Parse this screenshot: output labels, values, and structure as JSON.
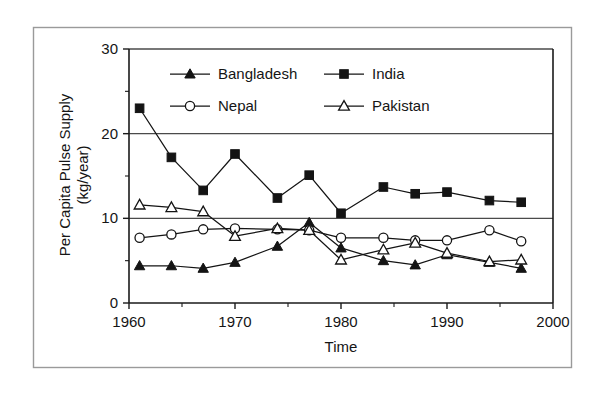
{
  "figure": {
    "caption_present": false,
    "frame_color": "#9a9a9a",
    "ink_color": "#141414"
  },
  "axes": {
    "y_title_line1": "Per Capita Pulse Supply",
    "y_title_line2": "(kg/year)",
    "x_title": "Time",
    "y_ticks": [
      "0",
      "10",
      "20",
      "30"
    ],
    "x_ticks": [
      "1960",
      "1970",
      "1980",
      "1990",
      "2000"
    ]
  },
  "legend": {
    "position": "inside-top-center",
    "entries": [
      {
        "label": "Bangladesh",
        "marker": "filled-triangle-icon"
      },
      {
        "label": "India",
        "marker": "filled-square-icon"
      },
      {
        "label": "Nepal",
        "marker": "open-circle-icon"
      },
      {
        "label": "Pakistan",
        "marker": "open-triangle-icon"
      }
    ]
  },
  "chart_data": {
    "type": "line",
    "title": "",
    "xlabel": "Time",
    "ylabel": "Per Capita Pulse Supply (kg/year)",
    "xlim": [
      1960,
      2000
    ],
    "ylim": [
      0,
      30
    ],
    "xticks": [
      1960,
      1970,
      1980,
      1990,
      2000
    ],
    "yticks": [
      0,
      10,
      20,
      30
    ],
    "minor_yticks": [
      5,
      15,
      25
    ],
    "minor_xticks": [
      1965,
      1975,
      1985,
      1995
    ],
    "grid": "horizontal-major",
    "legend_position": "upper center inside axes",
    "x": [
      1961,
      1964,
      1967,
      1970,
      1974,
      1977,
      1980,
      1984,
      1987,
      1990,
      1994,
      1997
    ],
    "series": [
      {
        "name": "Bangladesh",
        "marker": "filled-triangle",
        "values": [
          4.4,
          4.4,
          4.1,
          4.8,
          6.7,
          9.5,
          6.5,
          5.0,
          4.5,
          5.7,
          4.8,
          4.1
        ]
      },
      {
        "name": "India",
        "marker": "filled-square",
        "values": [
          23.0,
          17.2,
          13.3,
          17.6,
          12.4,
          15.1,
          10.6,
          13.7,
          12.9,
          13.1,
          12.1,
          11.9
        ]
      },
      {
        "name": "Nepal",
        "marker": "open-circle",
        "values": [
          7.7,
          8.1,
          8.7,
          8.8,
          8.7,
          8.6,
          7.7,
          7.7,
          7.4,
          7.4,
          8.6,
          7.3
        ]
      },
      {
        "name": "Pakistan",
        "marker": "open-triangle",
        "values": [
          11.6,
          11.3,
          10.8,
          7.9,
          8.8,
          8.6,
          5.1,
          6.3,
          7.1,
          5.9,
          4.9,
          5.1
        ]
      }
    ]
  }
}
